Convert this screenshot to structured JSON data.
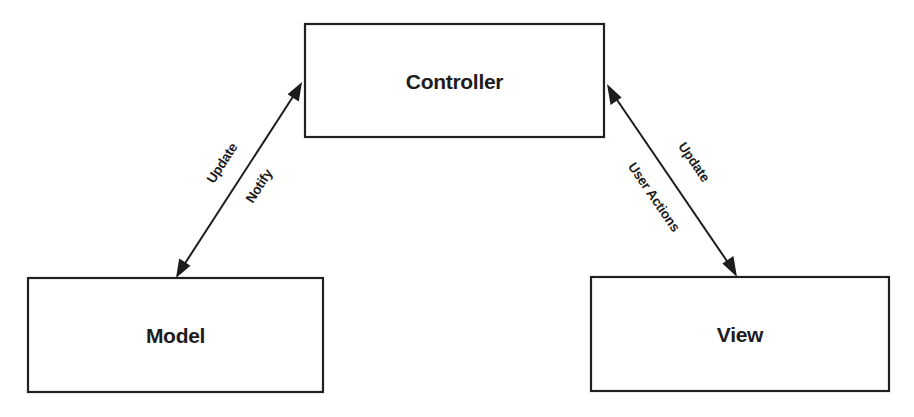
{
  "diagram": {
    "type": "mvc-architecture",
    "nodes": {
      "controller": {
        "label": "Controller"
      },
      "model": {
        "label": "Model"
      },
      "view": {
        "label": "View"
      }
    },
    "edges": {
      "controller_model": {
        "from": "Controller",
        "to": "Model",
        "direction": "bidirectional",
        "labels": [
          "Update",
          "Notify"
        ]
      },
      "controller_view": {
        "from": "Controller",
        "to": "View",
        "direction": "bidirectional",
        "labels": [
          "Update",
          "User Actions"
        ]
      }
    },
    "colors": {
      "stroke": "#231f20",
      "text": "#1e1c1d",
      "background": "#ffffff"
    }
  }
}
